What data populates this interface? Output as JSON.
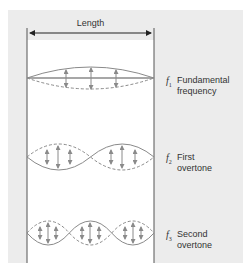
{
  "figure": {
    "header": {
      "length_label": "Length"
    },
    "modes": [
      {
        "symbol": "f",
        "subscript": "1",
        "line1": "Fundamental",
        "line2": "frequency",
        "lobes": 1
      },
      {
        "symbol": "f",
        "subscript": "2",
        "line1": "First",
        "line2": "overtone",
        "lobes": 2
      },
      {
        "symbol": "f",
        "subscript": "3",
        "line1": "Second",
        "line2": "overtone",
        "lobes": 3
      }
    ]
  },
  "colors": {
    "panel": "#ececec",
    "tube": "#ffffff",
    "wave": "#8a8a8a",
    "walls": "#555555"
  }
}
